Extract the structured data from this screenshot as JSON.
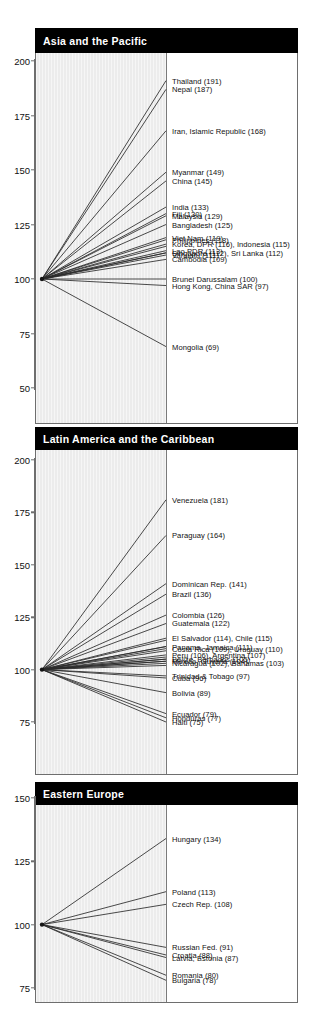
{
  "figure": {
    "baseline_value": 100,
    "panel_count": 3
  },
  "chart_data": {
    "type": "line",
    "title": "",
    "xlabel": "",
    "ylabel": "",
    "grid": false,
    "legend": "none",
    "panels": [
      {
        "title": "Asia and the Pacific",
        "ylim": [
          50,
          200
        ],
        "yticks": [
          200,
          175,
          150,
          125,
          100,
          75,
          50
        ],
        "start_value": 100,
        "labels": [
          {
            "text": "Thailand (191)",
            "value": 191
          },
          {
            "text": "Nepal (187)",
            "value": 187
          },
          {
            "text": "Iran, Islamic Republic (168)",
            "value": 168
          },
          {
            "text": "Myanmar (149)",
            "value": 149
          },
          {
            "text": "China  (145)",
            "value": 145
          },
          {
            "text": "India (133)",
            "value": 133
          },
          {
            "text": "Fiji (130)",
            "value": 130
          },
          {
            "text": "Malaysia (129)",
            "value": 129
          },
          {
            "text": "Bangladesh (125)",
            "value": 125
          },
          {
            "text": "Viet Nam (119)",
            "value": 119
          },
          {
            "text": "Philippines (118)",
            "value": 118
          },
          {
            "text": "Korea, DPR (116), Indonesia (115)",
            "value": 116
          },
          {
            "text": "Lao PDR (113)",
            "value": 113
          },
          {
            "text": "Singapore (112), Sri Lanka (112)",
            "value": 112
          },
          {
            "text": "Vanuatu (111)",
            "value": 111
          },
          {
            "text": "Cambodia (109)",
            "value": 109
          },
          {
            "text": "Brunei Darussalam (100)",
            "value": 100
          },
          {
            "text": "Hong Kong, China SAR (97)",
            "value": 97
          },
          {
            "text": "Mongolia (69)",
            "value": 69
          }
        ],
        "extra_series_values": [
          115,
          112
        ]
      },
      {
        "title": "Latin America and the Caribbean",
        "ylim": [
          70,
          200
        ],
        "yticks": [
          200,
          175,
          150,
          125,
          100,
          75
        ],
        "start_value": 100,
        "labels": [
          {
            "text": "Venezuela (181)",
            "value": 181
          },
          {
            "text": "Paraguay (164)",
            "value": 164
          },
          {
            "text": "Dominican Rep. (141)",
            "value": 141
          },
          {
            "text": "Brazil (136)",
            "value": 136
          },
          {
            "text": "Colombia (126)",
            "value": 126
          },
          {
            "text": "Guatemala (122)",
            "value": 122
          },
          {
            "text": "El Salvador (114), Chile (115)",
            "value": 115
          },
          {
            "text": "Panama, Jamaica (111)",
            "value": 111
          },
          {
            "text": "Costa Rica (109), Uruguay (110)",
            "value": 110
          },
          {
            "text": "Peru (106), Argentina (107)",
            "value": 107
          },
          {
            "text": "Belize, Barbados (105)",
            "value": 105
          },
          {
            "text": "Mexico, Guyana (104)",
            "value": 104
          },
          {
            "text": "Nicaragua (102), Bahamas (103)",
            "value": 103
          },
          {
            "text": "Trinidad & Tobago (97)",
            "value": 97
          },
          {
            "text": "Cuba (96)",
            "value": 96
          },
          {
            "text": "Bolivia (89)",
            "value": 89
          },
          {
            "text": "Ecuador (79)",
            "value": 79
          },
          {
            "text": "Honduras (77)",
            "value": 77
          },
          {
            "text": "Haiti (75)",
            "value": 75
          }
        ],
        "extra_series_values": [
          114,
          111,
          109,
          106,
          105,
          104,
          102
        ]
      },
      {
        "title": "Eastern Europe",
        "ylim": [
          70,
          150
        ],
        "yticks": [
          150,
          125,
          100,
          75
        ],
        "start_value": 100,
        "labels": [
          {
            "text": "Hungary (134)",
            "value": 134
          },
          {
            "text": "Poland (113)",
            "value": 113
          },
          {
            "text": "Czech Rep. (108)",
            "value": 108
          },
          {
            "text": "Russian Fed. (91)",
            "value": 91
          },
          {
            "text": "Croatia (88)",
            "value": 88
          },
          {
            "text": "Latvia, Estonia (87)",
            "value": 87
          },
          {
            "text": "Romania (80)",
            "value": 80
          },
          {
            "text": "Bulgaria (78)",
            "value": 78
          }
        ],
        "extra_series_values": []
      }
    ]
  }
}
